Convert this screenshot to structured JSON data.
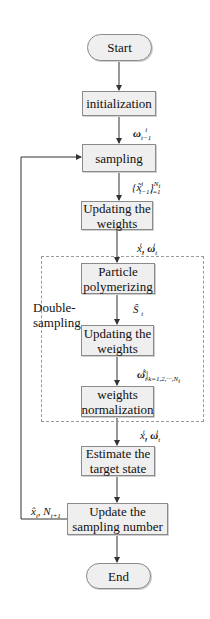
{
  "diagram": {
    "type": "flowchart",
    "nodes": {
      "start": "Start",
      "initialization": "initialization",
      "sampling": "sampling",
      "updating_weights_1": "Updating the weights",
      "particle_polymerizing": "Particle polymerizing",
      "updating_weights_2": "Updating the weights",
      "weights_normalization": "weights normalization",
      "estimate_target_state": "Estimate the target state",
      "update_sampling_number": "Update the sampling number",
      "end": "End"
    },
    "group": {
      "label": "Double-sampling",
      "style": "dashed"
    },
    "edge_labels": {
      "init_to_sampling": "ω_{t-1}^i",
      "sampling_to_update1": "{x̃_{t-1}^i}_{i=1}^{N_t}",
      "update1_to_polymerize": "x_t^i, ω_t^i",
      "polymerize_to_update2": "Ŝ_t",
      "update2_to_normalize": "ω_t^k |_{k=1,2,···,N_t}",
      "normalize_to_estimate": "x_t^i, ω_t^i",
      "feedback": "x̂_t, N_{t+1}"
    },
    "edges": [
      [
        "start",
        "initialization"
      ],
      [
        "initialization",
        "sampling"
      ],
      [
        "sampling",
        "updating_weights_1"
      ],
      [
        "updating_weights_1",
        "particle_polymerizing"
      ],
      [
        "particle_polymerizing",
        "updating_weights_2"
      ],
      [
        "updating_weights_2",
        "weights_normalization"
      ],
      [
        "weights_normalization",
        "estimate_target_state"
      ],
      [
        "estimate_target_state",
        "update_sampling_number"
      ],
      [
        "update_sampling_number",
        "end"
      ],
      [
        "update_sampling_number",
        "sampling"
      ]
    ],
    "colors": {
      "node_fill": "#efefef",
      "node_border": "#8a8a8a",
      "line": "#333333",
      "dashed_border": "#9a9a9a"
    }
  }
}
